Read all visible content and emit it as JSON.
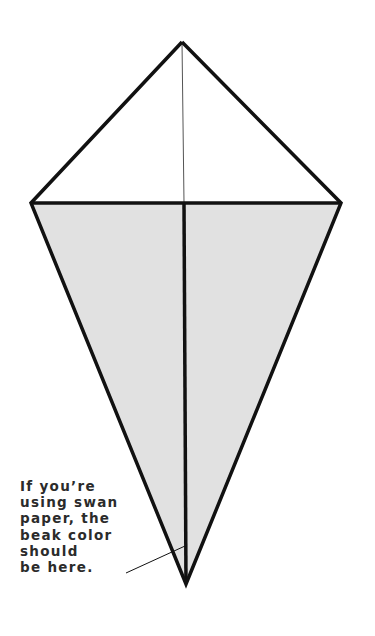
{
  "diagram": {
    "fill_color": "#e1e1e1",
    "line_color": "#111111",
    "vertices": {
      "top": [
        182,
        42
      ],
      "left": [
        31,
        203
      ],
      "right": [
        341,
        203
      ],
      "bottom": [
        186,
        584
      ]
    }
  },
  "caption": {
    "lines": [
      "If you’re",
      "using swan",
      "paper, the",
      "beak color",
      "should",
      "be here."
    ]
  }
}
